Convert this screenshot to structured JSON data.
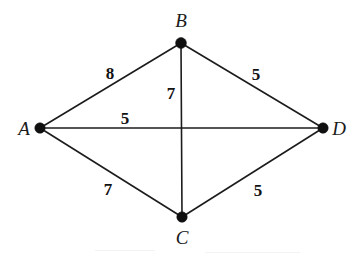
{
  "figure": {
    "kind": "weighted-undirected-graph",
    "background_color": "#ffffff",
    "line_color": "#1c1c1c",
    "node_color": "#101010",
    "text_color": "#1a1a1a",
    "width": 354,
    "height": 256
  },
  "nodes": [
    {
      "id": "A",
      "label": "A",
      "cx": 40,
      "cy": 128,
      "r": 5.2,
      "label_x": 24,
      "label_y": 128
    },
    {
      "id": "B",
      "label": "B",
      "cx": 181,
      "cy": 43,
      "r": 5.4,
      "label_x": 181,
      "label_y": 20
    },
    {
      "id": "C",
      "label": "C",
      "cx": 182,
      "cy": 217,
      "r": 5.2,
      "label_x": 182,
      "label_y": 237
    },
    {
      "id": "D",
      "label": "D",
      "cx": 323,
      "cy": 128,
      "r": 5.2,
      "label_x": 339,
      "label_y": 128
    }
  ],
  "edges": [
    {
      "id": "A-B",
      "from": "A",
      "to": "B",
      "weight": "8",
      "x1": 40,
      "y1": 128,
      "x2": 181,
      "y2": 43,
      "label_x": 110,
      "label_y": 73
    },
    {
      "id": "B-D",
      "from": "B",
      "to": "D",
      "weight": "5",
      "x1": 181,
      "y1": 43,
      "x2": 323,
      "y2": 128,
      "label_x": 256,
      "label_y": 74
    },
    {
      "id": "B-C",
      "from": "B",
      "to": "C",
      "weight": "7",
      "x1": 181,
      "y1": 43,
      "x2": 182,
      "y2": 217,
      "label_x": 171,
      "label_y": 93
    },
    {
      "id": "A-D",
      "from": "A",
      "to": "D",
      "weight": "5",
      "x1": 40,
      "y1": 128,
      "x2": 323,
      "y2": 128,
      "label_x": 125,
      "label_y": 118
    },
    {
      "id": "A-C",
      "from": "A",
      "to": "C",
      "weight": "7",
      "x1": 40,
      "y1": 128,
      "x2": 182,
      "y2": 217,
      "label_x": 108,
      "label_y": 189
    },
    {
      "id": "C-D",
      "from": "C",
      "to": "D",
      "weight": "5",
      "x1": 182,
      "y1": 217,
      "x2": 323,
      "y2": 128,
      "label_x": 258,
      "label_y": 190
    }
  ],
  "artifacts": [
    {
      "x": 95,
      "y": 250,
      "width": 60
    },
    {
      "x": 205,
      "y": 252,
      "width": 95
    }
  ]
}
